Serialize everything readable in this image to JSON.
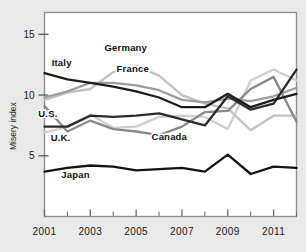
{
  "chart_data": {
    "type": "line",
    "title": "",
    "xlabel": "",
    "ylabel": "Misery index",
    "xlim": [
      2001,
      2012
    ],
    "ylim": [
      0,
      16.8
    ],
    "grid": false,
    "legend": "inline-labels",
    "x": [
      2001,
      2002,
      2003,
      2004,
      2005,
      2006,
      2007,
      2008,
      2009,
      2010,
      2011,
      2012
    ],
    "xticks": [
      2001,
      2003,
      2005,
      2007,
      2009,
      2011
    ],
    "xticklabels": [
      "2001",
      "2003",
      "2005",
      "2007",
      "2009",
      "2011"
    ],
    "yticks": [
      5,
      10,
      15
    ],
    "yticklabels": [
      "5",
      "10",
      "15"
    ],
    "series": [
      {
        "name": "Italy",
        "color": "#1d1d1d",
        "width": 2.3,
        "label_x": 2001.75,
        "label_y": 12.4,
        "values": [
          11.8,
          11.3,
          11.0,
          10.7,
          10.3,
          9.8,
          9.0,
          9.0,
          10.1,
          9.0,
          9.6,
          10.1
        ]
      },
      {
        "name": "Germany",
        "color": "#c2c2c2",
        "width": 2.3,
        "label_x": 2004.55,
        "label_y": 13.6,
        "values": [
          9.6,
          10.2,
          10.5,
          11.9,
          12.4,
          11.6,
          10.0,
          9.3,
          8.9,
          7.1,
          8.3,
          8.3
        ]
      },
      {
        "name": "France",
        "color": "#9d9d9d",
        "width": 2.3,
        "label_x": 2004.85,
        "label_y": 11.9,
        "values": [
          9.8,
          10.3,
          11.0,
          11.0,
          10.8,
          10.4,
          9.6,
          9.4,
          9.7,
          9.5,
          9.9,
          10.6
        ]
      },
      {
        "name": "U.S.",
        "color": "#2b2b2b",
        "width": 2.3,
        "label_x": 2001.15,
        "label_y": 8.2,
        "values": [
          7.4,
          7.4,
          8.3,
          8.2,
          8.3,
          8.5,
          8.0,
          7.5,
          9.9,
          8.8,
          9.3,
          12.1
        ]
      },
      {
        "name": "U.K.",
        "color": "#cfcfcf",
        "width": 2.3,
        "label_x": 2001.7,
        "label_y": 6.2,
        "values": [
          6.9,
          7.4,
          8.4,
          7.3,
          7.4,
          8.2,
          8.3,
          8.2,
          7.2,
          11.2,
          12.1,
          11.2
        ]
      },
      {
        "name": "Canada",
        "color": "#8a8a8a",
        "width": 2.3,
        "label_x": 2006.45,
        "label_y": 6.3,
        "values": [
          9.1,
          7.0,
          7.9,
          7.2,
          7.0,
          6.7,
          7.4,
          8.6,
          8.7,
          10.5,
          11.5,
          7.8
        ]
      },
      {
        "name": "Japan",
        "color": "#141414",
        "width": 2.3,
        "label_x": 2002.35,
        "label_y": 3.15,
        "values": [
          3.7,
          4.0,
          4.2,
          4.1,
          3.8,
          3.9,
          4.0,
          3.7,
          5.1,
          3.5,
          4.1,
          4.0
        ]
      }
    ]
  },
  "axes": {
    "ylabel_text": "Misery index"
  }
}
